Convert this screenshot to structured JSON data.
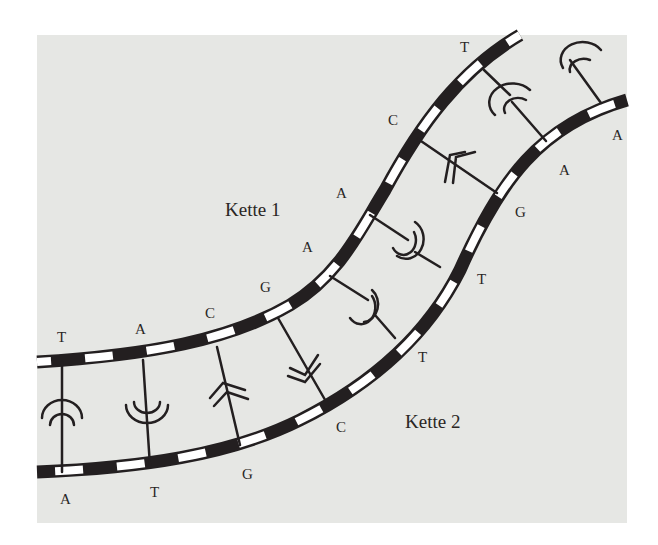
{
  "figure": {
    "type": "DNA double strand with complementary base pairs",
    "chain_labels": {
      "chain1": "Kette 1",
      "chain2": "Kette 2"
    },
    "colors": {
      "background": "#e6e7e4",
      "strand_dark": "#231f20",
      "strand_light": "#ffffff",
      "text": "#2a2624"
    },
    "pairs": [
      {
        "chain1": "T",
        "chain2": "A"
      },
      {
        "chain1": "A",
        "chain2": "T"
      },
      {
        "chain1": "C",
        "chain2": "G"
      },
      {
        "chain1": "G",
        "chain2": "C"
      },
      {
        "chain1": "A",
        "chain2": "T"
      },
      {
        "chain1": "A",
        "chain2": "T"
      },
      {
        "chain1": "C",
        "chain2": "G"
      },
      {
        "chain1": "T",
        "chain2": "A"
      },
      {
        "chain1": "",
        "chain2": "A"
      }
    ]
  }
}
